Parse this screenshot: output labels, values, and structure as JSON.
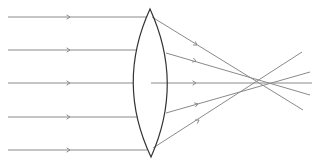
{
  "diagram": {
    "colors": {
      "ray": "#8a8a8a",
      "lens": "#333333",
      "background": "#ffffff"
    },
    "lens": {
      "top": [
        150,
        9
      ],
      "bottom": [
        151,
        157
      ],
      "left_x": 133,
      "right_x": 167
    },
    "incoming_rays": [
      {
        "y": 17,
        "arrow_x": 70
      },
      {
        "y": 50,
        "arrow_x": 70
      },
      {
        "y": 83,
        "arrow_x": 70
      },
      {
        "y": 117,
        "arrow_x": 70
      },
      {
        "y": 150,
        "arrow_x": 70
      }
    ],
    "outgoing_rays": [
      {
        "from": [
          152,
          17
        ],
        "to": [
          303,
          110
        ],
        "arrow_at": [
          197,
          45
        ]
      },
      {
        "from": [
          166,
          53
        ],
        "to": [
          310,
          95
        ],
        "arrow_at": [
          196,
          61
        ]
      },
      {
        "from": [
          151,
          83
        ],
        "to": [
          312,
          83
        ],
        "arrow_at": [
          196,
          83
        ]
      },
      {
        "from": [
          166,
          113
        ],
        "to": [
          310,
          72
        ],
        "arrow_at": [
          198,
          104
        ]
      },
      {
        "from": [
          153,
          148
        ],
        "to": [
          302,
          52
        ],
        "arrow_at": [
          199,
          120
        ]
      }
    ]
  }
}
